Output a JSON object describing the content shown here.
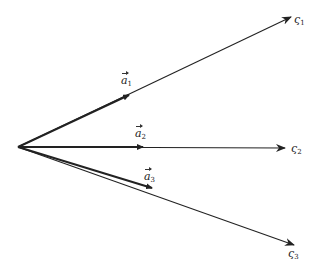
{
  "diagram": {
    "origin": {
      "x": 18,
      "y": 147
    },
    "line_color": "#222222",
    "rays": [
      {
        "id": "zeta1",
        "label_base": "ς",
        "label_sub": "1",
        "tip": {
          "x": 291,
          "y": 17
        },
        "label_pos": {
          "x": 294,
          "y": 14
        }
      },
      {
        "id": "zeta2",
        "label_base": "ς",
        "label_sub": "2",
        "tip": {
          "x": 285,
          "y": 148
        },
        "label_pos": {
          "x": 291,
          "y": 143
        }
      },
      {
        "id": "zeta3",
        "label_base": "ς",
        "label_sub": "3",
        "tip": {
          "x": 294,
          "y": 245
        },
        "label_pos": {
          "x": 288,
          "y": 248
        }
      }
    ],
    "vectors": [
      {
        "id": "a1",
        "label_base": "a",
        "label_sub": "1",
        "tip": {
          "x": 129,
          "y": 95
        },
        "label_pos": {
          "x": 121,
          "y": 75
        }
      },
      {
        "id": "a2",
        "label_base": "a",
        "label_sub": "2",
        "tip": {
          "x": 143,
          "y": 147
        },
        "label_pos": {
          "x": 135,
          "y": 128
        }
      },
      {
        "id": "a3",
        "label_base": "a",
        "label_sub": "3",
        "tip": {
          "x": 152,
          "y": 188
        },
        "label_pos": {
          "x": 144,
          "y": 171
        }
      }
    ]
  }
}
